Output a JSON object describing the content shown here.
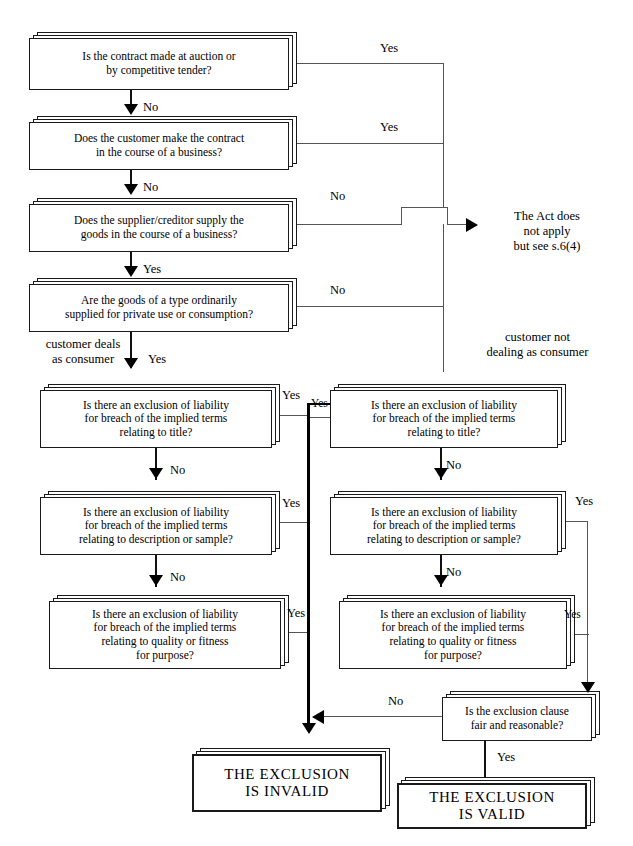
{
  "diagram": {
    "accent_color": "#000000",
    "line_color": "#555555"
  },
  "questions": {
    "q1": "Is the contract made at auction or\nby competitive tender?",
    "q2": "Does the customer make the contract\nin the course of a business?",
    "q3": "Does the supplier/creditor supply the\ngoods in the course of a business?",
    "q4": "Are the goods of a type ordinarily\nsupplied for private use or consumption?",
    "left_title": "Is there an exclusion of liability\nfor breach of the implied terms\nrelating to title?",
    "left_description": "Is there an exclusion of liability\nfor breach of the implied terms\nrelating to description or sample?",
    "left_quality": "Is there an exclusion of liability\nfor breach of the implied terms\nrelating to quality or fitness\nfor purpose?",
    "right_title": "Is there an exclusion of liability\nfor breach of the implied terms\nrelating to title?",
    "right_description": "Is there an exclusion of liability\nfor breach of the implied terms\nrelating to description or sample?",
    "right_quality": "Is there an exclusion of liability\nfor breach of the implied terms\nrelating to quality or fitness\nfor purpose?",
    "fair_reasonable": "Is the exclusion clause\nfair and reasonable?"
  },
  "outcomes": {
    "act_does_not_apply": "The Act does\nnot apply\nbut see s.6(4)",
    "exclusion_invalid": "THE EXCLUSION\nIS INVALID",
    "exclusion_valid": "THE EXCLUSION\nIS VALID"
  },
  "notes": {
    "customer_deals_as_consumer": "customer deals\nas consumer",
    "customer_not_dealing": "customer not\ndealing as consumer"
  },
  "labels": {
    "yes": "Yes",
    "no": "No",
    "q1_yes": "Yes",
    "q1_no": "No",
    "q2_yes": "Yes",
    "q2_no": "No",
    "q3_no": "No",
    "q3_yes": "Yes",
    "q4_no": "No",
    "q4_yes": "Yes",
    "lt_yes": "Yes",
    "lt_no": "No",
    "ld_yes": "Yes",
    "ld_no": "No",
    "lq_yes": "Yes",
    "rt_cross_yes": "Yes",
    "rt_no": "No",
    "rd_yes": "Yes",
    "rd_no": "No",
    "rq_yes": "Yes",
    "fr_no": "No",
    "fr_yes": "Yes"
  }
}
